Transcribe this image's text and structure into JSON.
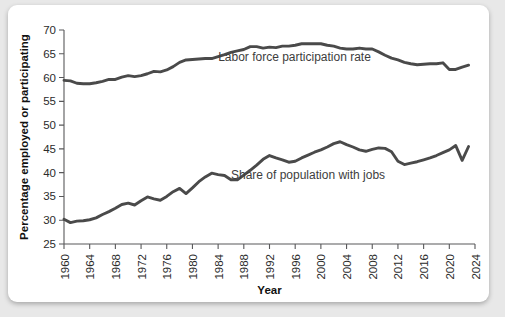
{
  "figure": {
    "background_color": "#e8e8e8",
    "card_color": "#ffffff",
    "line_color": "#4a4a4a",
    "axis_color": "#58585a"
  },
  "chart_data": {
    "type": "line",
    "title": "",
    "xlabel": "Year",
    "ylabel": "Percentage employed or participating",
    "xlim": [
      1960,
      2024
    ],
    "ylim": [
      25,
      70
    ],
    "ytick_values": [
      25,
      30,
      35,
      40,
      45,
      50,
      55,
      60,
      65,
      70
    ],
    "ytick_labels": [
      "25",
      "30",
      "35",
      "40",
      "45",
      "50",
      "55",
      "60",
      "65",
      "70"
    ],
    "xtick_values": [
      1960,
      1964,
      1968,
      1972,
      1976,
      1980,
      1984,
      1988,
      1992,
      1996,
      2000,
      2004,
      2008,
      2012,
      2016,
      2020,
      2024
    ],
    "xtick_labels": [
      "1960",
      "1964",
      "1968",
      "1972",
      "1976",
      "1980",
      "1984",
      "1988",
      "1992",
      "1996",
      "2000",
      "2004",
      "2008",
      "2012",
      "2016",
      "2020",
      "2024"
    ],
    "grid": false,
    "legend_position": "inline-annotation",
    "x": [
      1960,
      1961,
      1962,
      1963,
      1964,
      1965,
      1966,
      1967,
      1968,
      1969,
      1970,
      1971,
      1972,
      1973,
      1974,
      1975,
      1976,
      1977,
      1978,
      1979,
      1980,
      1981,
      1982,
      1983,
      1984,
      1985,
      1986,
      1987,
      1988,
      1989,
      1990,
      1991,
      1992,
      1993,
      1994,
      1995,
      1996,
      1997,
      1998,
      1999,
      2000,
      2001,
      2002,
      2003,
      2004,
      2005,
      2006,
      2007,
      2008,
      2009,
      2010,
      2011,
      2012,
      2013,
      2014,
      2015,
      2016,
      2017,
      2018,
      2019,
      2020,
      2021,
      2022,
      2023
    ],
    "series": [
      {
        "name": "Labor force participation rate",
        "label_x": 1984,
        "label_y": 63.4,
        "values": [
          59.4,
          59.3,
          58.8,
          58.7,
          58.7,
          58.9,
          59.2,
          59.6,
          59.6,
          60.1,
          60.4,
          60.2,
          60.4,
          60.8,
          61.3,
          61.2,
          61.6,
          62.3,
          63.2,
          63.7,
          63.8,
          63.9,
          64.0,
          64.0,
          64.4,
          64.8,
          65.3,
          65.6,
          65.9,
          66.5,
          66.5,
          66.2,
          66.4,
          66.3,
          66.6,
          66.6,
          66.8,
          67.1,
          67.1,
          67.1,
          67.1,
          66.8,
          66.6,
          66.2,
          66.0,
          66.0,
          66.2,
          66.0,
          66.0,
          65.4,
          64.7,
          64.1,
          63.7,
          63.2,
          62.9,
          62.7,
          62.8,
          62.9,
          62.9,
          63.1,
          61.7,
          61.7,
          62.2,
          62.6
        ]
      },
      {
        "name": "Share of population with jobs",
        "label_x": 1986,
        "label_y": 38.6,
        "values": [
          30.2,
          29.5,
          29.8,
          29.9,
          30.1,
          30.5,
          31.2,
          31.8,
          32.5,
          33.3,
          33.6,
          33.2,
          34.1,
          34.9,
          34.5,
          34.2,
          35.0,
          36.0,
          36.7,
          35.6,
          36.8,
          38.1,
          39.1,
          39.9,
          39.6,
          39.4,
          38.5,
          38.5,
          39.5,
          40.5,
          41.6,
          42.8,
          43.6,
          43.1,
          42.7,
          42.2,
          42.4,
          43.1,
          43.7,
          44.3,
          44.8,
          45.4,
          46.1,
          46.5,
          45.9,
          45.4,
          44.8,
          44.5,
          44.9,
          45.2,
          45.1,
          44.4,
          42.4,
          41.7,
          42.0,
          42.3,
          42.7,
          43.1,
          43.6,
          44.2,
          44.8,
          45.7,
          42.6,
          45.5
        ]
      }
    ]
  }
}
